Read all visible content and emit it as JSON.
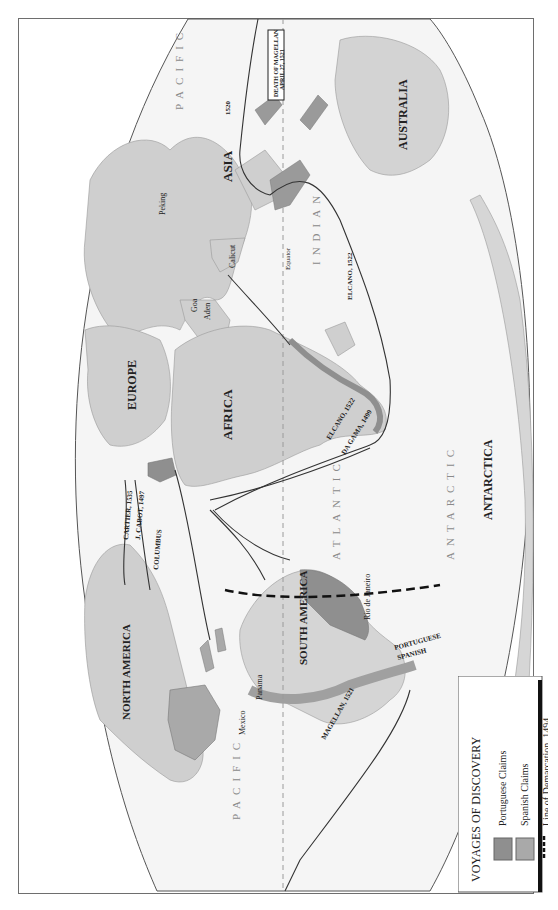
{
  "map": {
    "title": "VOYAGES OF DISCOVERY",
    "orientation": "rotated 90 degrees counter-clockwise (north at left)",
    "colors": {
      "land": "#c9c9c9",
      "portuguese_claims": "#8f8f8f",
      "spanish_claims": "#a9a9a9",
      "ocean": "#f4f4f4",
      "route": "#333333",
      "frame": "#6e6e6e"
    },
    "continents": [
      "NORTH AMERICA",
      "SOUTH AMERICA",
      "EUROPE",
      "AFRICA",
      "ASIA",
      "AUSTRALIA",
      "ANTARCTICA"
    ],
    "oceans": {
      "pacific_north": [
        "PACIFIC",
        "OCEAN"
      ],
      "pacific_south": [
        "PACIFIC",
        "OCEAN"
      ],
      "atlantic": [
        "ATLANTIC",
        "OCEAN"
      ],
      "indian": [
        "INDIAN",
        "OCEAN"
      ],
      "antarctic": [
        "ANTARCTIC",
        "OCEAN"
      ]
    },
    "regions": [
      "NEWFOUNDLAND",
      "ENGLAND",
      "FRANCE",
      "PORT.",
      "SPAIN",
      "GUINEA",
      "CONGO",
      "ANGOLA",
      "ETHIOPIA",
      "INDIA",
      "CHINA",
      "JAPAN",
      "CEYLON",
      "BORNEO",
      "SUMATRA",
      "JAVA",
      "EAST",
      "PAPUA",
      "AMBOINA",
      "PHILIPPINE ISLANDS",
      "MADAGASCAR",
      "BRAZIL",
      "CHILE",
      "PERU",
      "PATAGONIA",
      "NEW SPAIN",
      "CUBA",
      "WEST INDIES",
      "HISPANIOLA",
      "AZORES",
      "CANARY ISLANDS",
      "CAPE VERDE ISLANDS",
      "VERA",
      "CRUZ"
    ],
    "cities": [
      "Peking",
      "Macao (PORT.)",
      "Calicut",
      "Goa",
      "Aden",
      "Malindi",
      "Mombasa",
      "Mozambique",
      "Lourenço Marques",
      "Cape of Good Hope",
      "Rio de Janeiro",
      "Lima",
      "Cuzco",
      "Panama",
      "Mexico",
      "Cape Horn"
    ],
    "equator_label": "Equator",
    "demarcation": {
      "portuguese": "PORTUGUESE",
      "spanish": "SPANISH"
    },
    "voyages": [
      {
        "name": "COLUMBUS",
        "label": "COLUMBUS",
        "year": "1st 1492"
      },
      {
        "name": "CABOT",
        "label": "J. CABOT, 1497"
      },
      {
        "name": "CARTIER",
        "label": "CARTIER, 1535"
      },
      {
        "name": "CABOT_1498",
        "label": "1498"
      },
      {
        "name": "VESPUCCI",
        "label": "VESPUCCI",
        "year": "1497"
      },
      {
        "name": "DA_GAMA_AFRICA",
        "label": "DA GAMA, 1499"
      },
      {
        "name": "DA_GAMA_INDIA",
        "label": "DA GAMA, 1498"
      },
      {
        "name": "ELCANO_ATL",
        "label": "ELCANO, 1522"
      },
      {
        "name": "ELCANO_IND",
        "label": "ELCANO, 1522"
      },
      {
        "name": "MAGELLAN_ATL",
        "label": "MAGELLAN",
        "year": "1519"
      },
      {
        "name": "MAGELLAN_PAC",
        "label": "MAGELLAN, 1521"
      },
      {
        "name": "MAGELLAN_PAC_N",
        "label": "MAGELLAN, 1521"
      },
      {
        "name": "MAGELLAN_STRAIT",
        "label": "1520"
      }
    ],
    "callout": {
      "line1": "DEATH OF MAGELLAN",
      "line2": "APRIL 27, 1521"
    }
  },
  "legend": {
    "title": "VOYAGES OF DISCOVERY",
    "items": [
      {
        "label": "Portuguese Claims",
        "swatch": "#8f8f8f"
      },
      {
        "label": "Spanish Claims",
        "swatch": "#a9a9a9"
      },
      {
        "label": "Line of Demarcation, 1494",
        "swatch": "dashed"
      }
    ]
  }
}
